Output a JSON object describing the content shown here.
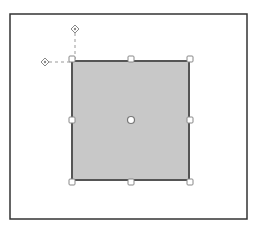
{
  "diagram": {
    "frame": {
      "x": 10,
      "y": 14,
      "width": 237,
      "height": 205,
      "stroke": "#333333"
    },
    "shape": {
      "type": "rectangle",
      "x": 72,
      "y": 61,
      "width": 117,
      "height": 119,
      "fill": "#c8c8c8",
      "stroke": "#555555"
    },
    "selection_handles": [
      {
        "name": "top-left",
        "x": 72,
        "y": 59
      },
      {
        "name": "top-center",
        "x": 131,
        "y": 59
      },
      {
        "name": "top-right",
        "x": 190,
        "y": 59
      },
      {
        "name": "middle-left",
        "x": 72,
        "y": 120
      },
      {
        "name": "middle-right",
        "x": 190,
        "y": 120
      },
      {
        "name": "bottom-left",
        "x": 72,
        "y": 182
      },
      {
        "name": "bottom-center",
        "x": 131,
        "y": 182
      },
      {
        "name": "bottom-right",
        "x": 190,
        "y": 182
      }
    ],
    "center_handle": {
      "x": 131,
      "y": 120
    },
    "rotation_handles": [
      {
        "name": "vertical-guide",
        "x": 75,
        "y": 29
      },
      {
        "name": "horizontal-guide",
        "x": 45,
        "y": 62
      }
    ],
    "handle_color": "#888888"
  }
}
